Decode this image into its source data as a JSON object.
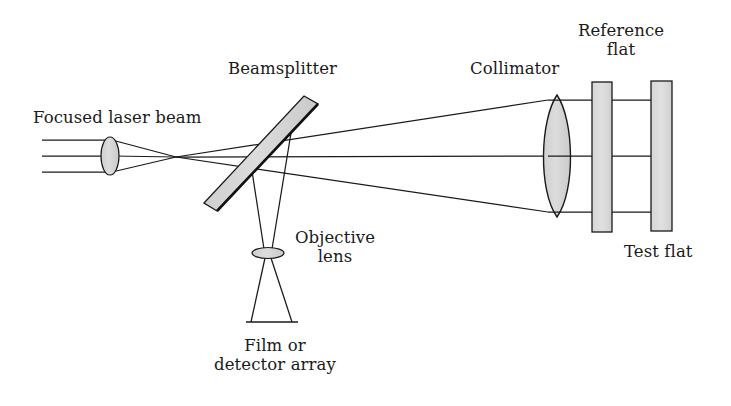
{
  "figure": {
    "type": "optical-ray-diagram",
    "background_color": "#ffffff",
    "ink_color": "#1a1a1a",
    "glass_fill_color": "#d4d4d4",
    "width": 731,
    "height": 406
  },
  "labels": {
    "focused_laser_beam": "Focused laser beam",
    "beamsplitter": "Beamsplitter",
    "collimator": "Collimator",
    "reference_flat": "Reference\nflat",
    "test_flat": "Test flat",
    "objective_lens": "Objective\nlens",
    "film_or_detector_array": "Film or\ndetector array"
  },
  "components": [
    {
      "name": "input-focusing-lens",
      "shape": "biconvex-lens-ellipse",
      "cx": 110,
      "cy": 156,
      "rx": 9,
      "ry": 19
    },
    {
      "name": "beamsplitter",
      "shape": "tilted-plate",
      "x1": 210,
      "y1": 208,
      "x2": 314,
      "y2": 100,
      "thickness": 14,
      "tilt_degrees": 45
    },
    {
      "name": "objective-lens",
      "shape": "thin-lens-ellipse",
      "cx": 268,
      "cy": 253,
      "rx": 16,
      "ry": 5.5
    },
    {
      "name": "film-or-detector-array",
      "shape": "line",
      "x1": 248,
      "y1": 322,
      "x2": 297,
      "y2": 322
    },
    {
      "name": "collimator-lens",
      "shape": "biconvex-lens",
      "cx": 557,
      "cy": 156,
      "rx": 17,
      "ry": 60
    },
    {
      "name": "reference-flat",
      "shape": "rectangle-plate",
      "x": 592,
      "y": 82,
      "width": 20,
      "height": 150
    },
    {
      "name": "test-flat",
      "shape": "rectangle-plate",
      "x": 651,
      "y": 81,
      "width": 21,
      "height": 150
    }
  ],
  "rays": {
    "input_parallel_rays_y": [
      140,
      156,
      172
    ],
    "input_ray_x_start": 42,
    "focus_point": {
      "x": 176,
      "y": 157
    },
    "collimator_edge_y_upper": 100,
    "collimator_edge_y_lower": 212,
    "collimated_rays_y": [
      100,
      156,
      212
    ],
    "collimated_ray_x_end": 672,
    "detector_ray_end_x": [
      251,
      292
    ],
    "detector_ray_end_y": 322
  },
  "label_positions": {
    "focused_laser_beam": {
      "x": 35,
      "y": 108
    },
    "beamsplitter": {
      "x": 228,
      "y": 58
    },
    "collimator": {
      "x": 468,
      "y": 58
    },
    "reference_flat": {
      "x": 573,
      "y": 22
    },
    "test_flat": {
      "x": 627,
      "y": 243
    },
    "objective_lens": {
      "x": 292,
      "y": 228
    },
    "film_or_detector_array": {
      "x": 212,
      "y": 335
    }
  }
}
